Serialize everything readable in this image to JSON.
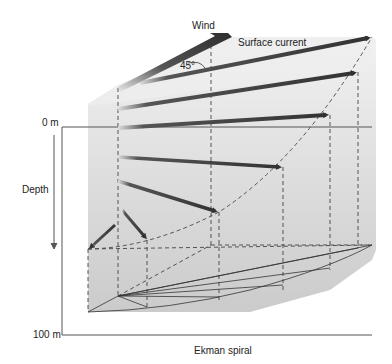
{
  "title": "Ekman spiral",
  "labels": {
    "wind": "Wind",
    "surface_current": "Surface current",
    "angle": "45°",
    "depth_top": "0 m",
    "depth_axis": "Depth",
    "depth_bottom": "100 m",
    "caption": "Ekman spiral"
  },
  "colors": {
    "background": "#ffffff",
    "water_top": "#efefef",
    "water_body": "#dcdcdc",
    "water_bottom": "#c8c8c8",
    "arrow": "#3a3a3a",
    "line": "#555555",
    "dashed": "#444444"
  },
  "arrows": [
    {
      "name": "wind",
      "x1": 118,
      "y1": 85,
      "x2": 228,
      "y2": 33
    },
    {
      "name": "surface",
      "x1": 140,
      "y1": 83,
      "x2": 372,
      "y2": 37
    },
    {
      "name": "depth-1",
      "x1": 118,
      "y1": 109,
      "x2": 358,
      "y2": 72
    },
    {
      "name": "depth-2",
      "x1": 118,
      "y1": 128,
      "x2": 330,
      "y2": 115
    },
    {
      "name": "depth-3",
      "x1": 118,
      "y1": 157,
      "x2": 283,
      "y2": 167
    },
    {
      "name": "depth-4",
      "x1": 118,
      "y1": 181,
      "x2": 219,
      "y2": 212
    },
    {
      "name": "depth-5",
      "x1": 122,
      "y1": 210,
      "x2": 147,
      "y2": 240
    },
    {
      "name": "depth-6",
      "x1": 115,
      "y1": 225,
      "x2": 88,
      "y2": 249
    }
  ]
}
